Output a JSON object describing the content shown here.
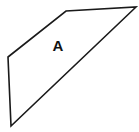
{
  "figure": {
    "type": "geometry-diagram",
    "background_color": "#ffffff",
    "stroke_color": "#1a1a1a",
    "fill_color": "#ffffff",
    "stroke_width": 1.6,
    "canvas": {
      "width": 139,
      "height": 132
    },
    "shape": {
      "name": "quadrilateral",
      "label": "A",
      "label_position": {
        "x": 58,
        "y": 47
      },
      "vertices": [
        {
          "x": 8,
          "y": 57
        },
        {
          "x": 66,
          "y": 11
        },
        {
          "x": 136,
          "y": 7
        },
        {
          "x": 11,
          "y": 126
        }
      ],
      "edges": [
        {
          "name": "upper-left-edge",
          "from": 0,
          "to": 1
        },
        {
          "name": "top-edge",
          "from": 1,
          "to": 2
        },
        {
          "name": "diagonal-edge",
          "from": 2,
          "to": 3
        },
        {
          "name": "left-edge",
          "from": 3,
          "to": 0
        }
      ]
    }
  }
}
